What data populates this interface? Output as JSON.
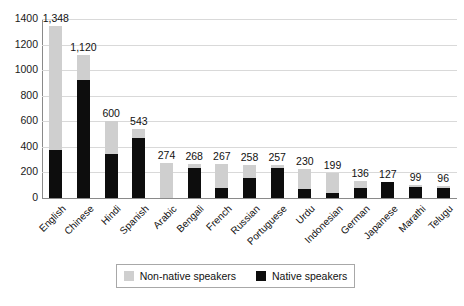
{
  "chart_data": {
    "type": "bar",
    "title": "",
    "subtitle": "",
    "xlabel": "",
    "ylabel": "",
    "ylim": [
      0,
      1400
    ],
    "yticks": [
      0,
      200,
      400,
      600,
      800,
      1000,
      1200,
      1400
    ],
    "ytick_labels": [
      "0",
      "200",
      "400",
      "600",
      "800",
      "1000",
      "1200",
      "1400"
    ],
    "grid": true,
    "stacked": true,
    "legend_position": "bottom",
    "categories": [
      "English",
      "Chinese",
      "Hindi",
      "Spanish",
      "Arabic",
      "Bengali",
      "French",
      "Russian",
      "Portuguese",
      "Urdu",
      "Indonesian",
      "German",
      "Japanese",
      "Marathi",
      "Telugu"
    ],
    "series": [
      {
        "name": "Native speakers",
        "color": "#0d0d0d",
        "values": [
          372,
          921,
          342,
          471,
          0,
          234,
          77,
          154,
          232,
          70,
          43,
          76,
          125,
          83,
          82
        ]
      },
      {
        "name": "Non-native speakers",
        "color": "#cfcfcf",
        "values": [
          976,
          199,
          258,
          72,
          274,
          34,
          190,
          104,
          25,
          160,
          156,
          60,
          2,
          16,
          14
        ]
      }
    ],
    "totals": [
      1348,
      1120,
      600,
      543,
      274,
      268,
      267,
      258,
      257,
      230,
      199,
      136,
      127,
      99,
      96
    ],
    "total_labels": [
      "1,348",
      "1,120",
      "600",
      "543",
      "274",
      "268",
      "267",
      "258",
      "257",
      "230",
      "199",
      "136",
      "127",
      "99",
      "96"
    ]
  },
  "legend": {
    "items": [
      {
        "label": "Non-native speakers",
        "color": "#cfcfcf"
      },
      {
        "label": "Native speakers",
        "color": "#0d0d0d"
      }
    ]
  }
}
